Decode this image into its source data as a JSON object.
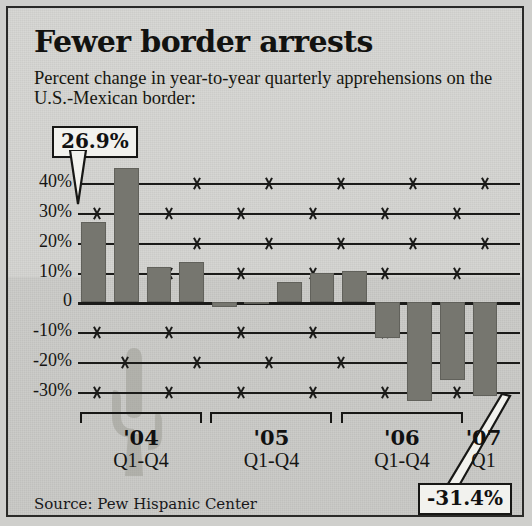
{
  "title": "Fewer border arrests",
  "subtitle": "Percent change in year-to-year quarterly apprehensions on the U.S.-Mexican border:",
  "source": "Source: Pew Hispanic Center",
  "callouts": {
    "high": "26.9%",
    "low": "-31.4%"
  },
  "axis": {
    "y_ticks": [
      "40%",
      "30%",
      "20%",
      "10%",
      "0",
      "-10%",
      "-20%",
      "-30%"
    ],
    "y_values": [
      40,
      30,
      20,
      10,
      0,
      -10,
      -20,
      -30
    ]
  },
  "groups": [
    {
      "year": "'04",
      "quarters": "Q1-Q4"
    },
    {
      "year": "'05",
      "quarters": "Q1-Q4"
    },
    {
      "year": "'06",
      "quarters": "Q1-Q4"
    },
    {
      "year": "'07",
      "quarters": "Q1"
    }
  ],
  "colors": {
    "bar": "#76766f",
    "background": "#d4d4d1",
    "ink": "#171715",
    "callout_fill": "#f2f2ee"
  },
  "chart_data": {
    "type": "bar",
    "title": "Fewer border arrests",
    "subtitle": "Percent change in year-to-year quarterly apprehensions on the U.S.-Mexican border:",
    "xlabel": "",
    "ylabel": "Percent change",
    "ylim": [
      -35,
      45
    ],
    "grid": true,
    "legend": "none",
    "categories": [
      "'04 Q1",
      "'04 Q2",
      "'04 Q3",
      "'04 Q4",
      "'05 Q1",
      "'05 Q2",
      "'05 Q3",
      "'05 Q4",
      "'06 Q1",
      "'06 Q2",
      "'06 Q3",
      "'06 Q4",
      "'07 Q1"
    ],
    "values": [
      26.9,
      45.0,
      12.0,
      13.5,
      -1.5,
      -0.5,
      7.0,
      10.0,
      10.5,
      -12.0,
      -33.0,
      -26.0,
      -31.4
    ],
    "annotations": [
      {
        "category": "'04 Q1",
        "label": "26.9%"
      },
      {
        "category": "'07 Q1",
        "label": "-31.4%"
      }
    ]
  }
}
